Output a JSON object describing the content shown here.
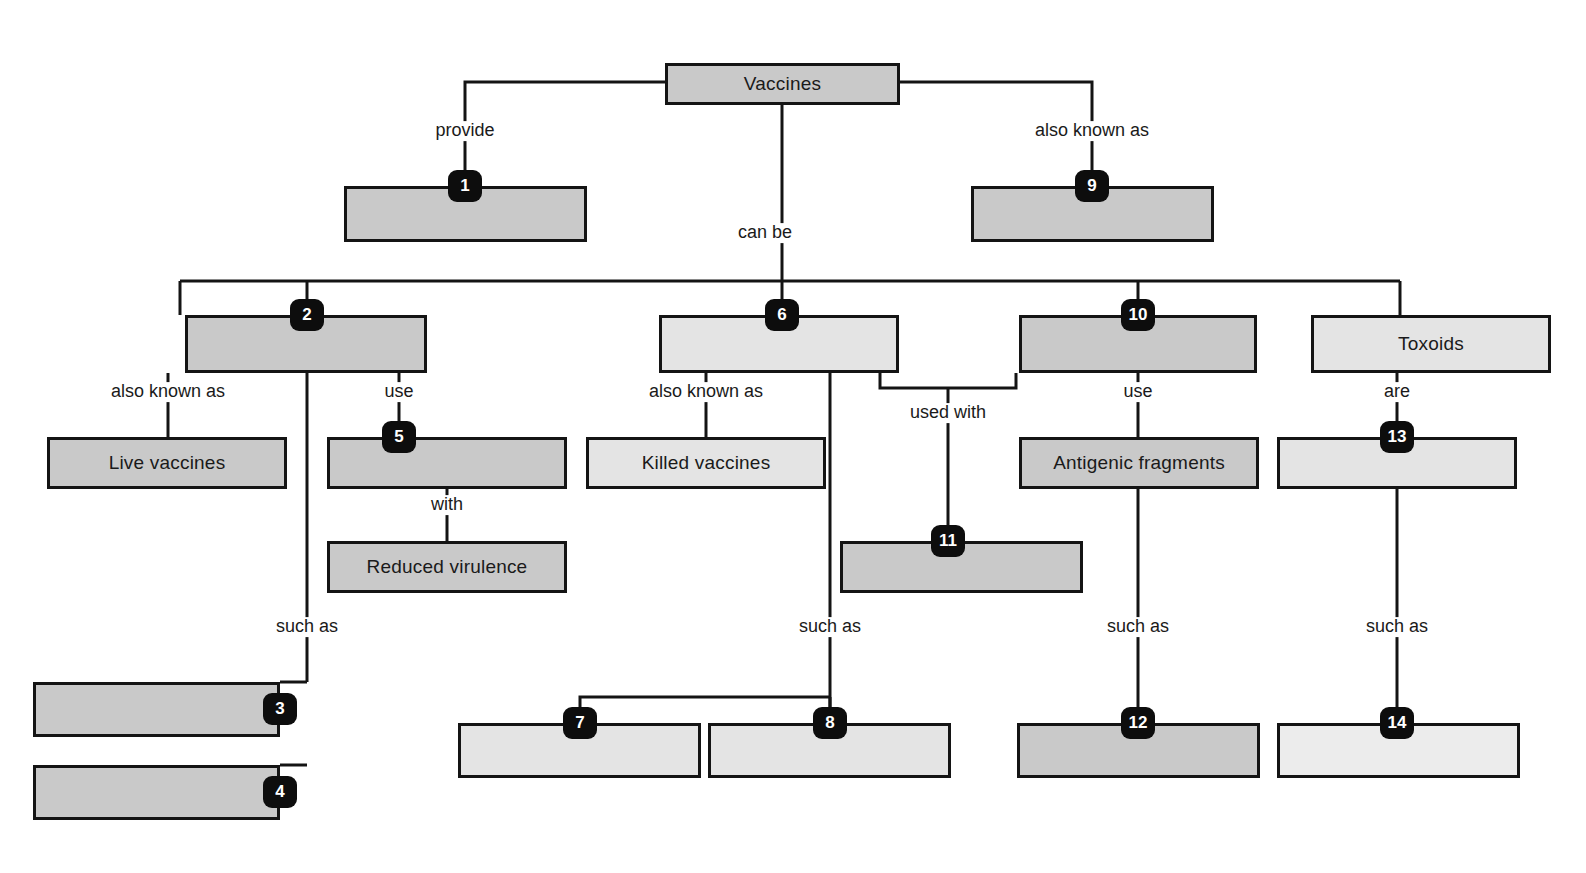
{
  "diagram": {
    "colors": {
      "line": "#141414",
      "fill_dark": "#c9c9c9",
      "fill_light": "#e4e4e4",
      "badge": "#0d0d0d"
    },
    "nodes": [
      {
        "id": "vaccines",
        "label": "Vaccines",
        "x": 665,
        "y": 63,
        "w": 235,
        "h": 42,
        "fill": "fill-dark",
        "badge": ""
      },
      {
        "id": "n1",
        "label": "",
        "x": 344,
        "y": 186,
        "w": 243,
        "h": 56,
        "fill": "fill-dark",
        "badge": "1"
      },
      {
        "id": "n9",
        "label": "",
        "x": 971,
        "y": 186,
        "w": 243,
        "h": 56,
        "fill": "fill-dark",
        "badge": "9"
      },
      {
        "id": "n2",
        "label": "",
        "x": 185,
        "y": 315,
        "w": 242,
        "h": 58,
        "fill": "fill-dark",
        "badge": "2"
      },
      {
        "id": "n6",
        "label": "",
        "x": 659,
        "y": 315,
        "w": 240,
        "h": 58,
        "fill": "fill-light",
        "badge": "6"
      },
      {
        "id": "n10",
        "label": "",
        "x": 1019,
        "y": 315,
        "w": 238,
        "h": 58,
        "fill": "fill-dark",
        "badge": "10"
      },
      {
        "id": "toxoids",
        "label": "Toxoids",
        "x": 1311,
        "y": 315,
        "w": 240,
        "h": 58,
        "fill": "fill-light",
        "badge": ""
      },
      {
        "id": "live",
        "label": "Live vaccines",
        "x": 47,
        "y": 437,
        "w": 240,
        "h": 52,
        "fill": "fill-dark",
        "badge": ""
      },
      {
        "id": "n5",
        "label": "",
        "x": 327,
        "y": 437,
        "w": 240,
        "h": 52,
        "fill": "fill-dark",
        "badge": "5"
      },
      {
        "id": "killed",
        "label": "Killed vaccines",
        "x": 586,
        "y": 437,
        "w": 240,
        "h": 52,
        "fill": "fill-light",
        "badge": ""
      },
      {
        "id": "antigenic",
        "label": "Antigenic fragments",
        "x": 1019,
        "y": 437,
        "w": 240,
        "h": 52,
        "fill": "fill-dark",
        "badge": ""
      },
      {
        "id": "n13",
        "label": "",
        "x": 1277,
        "y": 437,
        "w": 240,
        "h": 52,
        "fill": "fill-light",
        "badge": "13"
      },
      {
        "id": "reduced",
        "label": "Reduced virulence",
        "x": 327,
        "y": 541,
        "w": 240,
        "h": 52,
        "fill": "fill-dark",
        "badge": ""
      },
      {
        "id": "n11",
        "label": "",
        "x": 840,
        "y": 541,
        "w": 243,
        "h": 52,
        "fill": "fill-dark",
        "badge": "11"
      },
      {
        "id": "n3",
        "label": "",
        "x": 33,
        "y": 682,
        "w": 247,
        "h": 55,
        "fill": "fill-dark",
        "badge": "3"
      },
      {
        "id": "n4",
        "label": "",
        "x": 33,
        "y": 765,
        "w": 247,
        "h": 55,
        "fill": "fill-dark",
        "badge": "4"
      },
      {
        "id": "n7",
        "label": "",
        "x": 458,
        "y": 723,
        "w": 243,
        "h": 55,
        "fill": "fill-light",
        "badge": "7"
      },
      {
        "id": "n8",
        "label": "",
        "x": 708,
        "y": 723,
        "w": 243,
        "h": 55,
        "fill": "fill-light",
        "badge": "8"
      },
      {
        "id": "n12",
        "label": "",
        "x": 1017,
        "y": 723,
        "w": 243,
        "h": 55,
        "fill": "fill-dark",
        "badge": "12"
      },
      {
        "id": "n14",
        "label": "",
        "x": 1277,
        "y": 723,
        "w": 243,
        "h": 55,
        "fill": "fill-lightest",
        "badge": "14"
      }
    ],
    "edge_labels": [
      {
        "id": "provide",
        "text": "provide",
        "x": 465,
        "y": 131
      },
      {
        "id": "also-9",
        "text": "also known as",
        "x": 1092,
        "y": 131
      },
      {
        "id": "can-be",
        "text": "can be",
        "x": 765,
        "y": 233
      },
      {
        "id": "also-2",
        "text": "also known as",
        "x": 168,
        "y": 392
      },
      {
        "id": "use-5",
        "text": "use",
        "x": 399,
        "y": 392
      },
      {
        "id": "also-6",
        "text": "also known as",
        "x": 706,
        "y": 392
      },
      {
        "id": "used-with",
        "text": "used with",
        "x": 948,
        "y": 413
      },
      {
        "id": "use-12",
        "text": "use",
        "x": 1138,
        "y": 392
      },
      {
        "id": "are-13",
        "text": "are",
        "x": 1397,
        "y": 392
      },
      {
        "id": "with",
        "text": "with",
        "x": 447,
        "y": 505
      },
      {
        "id": "such-as-34",
        "text": "such as",
        "x": 307,
        "y": 627
      },
      {
        "id": "such-as-78",
        "text": "such as",
        "x": 830,
        "y": 627
      },
      {
        "id": "such-as-12",
        "text": "such as",
        "x": 1138,
        "y": 627
      },
      {
        "id": "such-as-14",
        "text": "such as",
        "x": 1397,
        "y": 627
      }
    ],
    "edges": [
      "M782,105 L782,281",
      "M665,82 L465,82 L465,186",
      "M900,82 L1092,82 L1092,186",
      "M180,281 L1400,281",
      "M307,281 L307,315",
      "M782,281 L782,315",
      "M1138,281 L1138,315",
      "M180,281 L180,315",
      "M1400,281 L1400,315",
      "M168,373 L168,437",
      "M307,373 L307,682",
      "M399,373 L399,437",
      "M706,373 L706,437",
      "M830,373 L830,723",
      "M880,373 L880,388 L1016,388 L1016,373",
      "M948,388 L948,541",
      "M1138,373 L1138,437",
      "M1397,373 L1397,437",
      "M447,489 L447,541",
      "M1138,489 L1138,723",
      "M1397,489 L1397,723",
      "M307,682 L280,682",
      "M307,765 L280,765",
      "M830,697 L580,697 L580,723",
      "M830,697 L830,723"
    ]
  }
}
